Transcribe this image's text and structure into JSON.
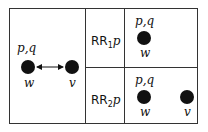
{
  "left_panel": {
    "w_label": "w",
    "v_label": "v",
    "pq_label": "p,q",
    "edge": "bidirectional-arrow"
  },
  "rows": [
    {
      "rule_prefix": "RR",
      "rule_sub": "1",
      "rule_arg": "p",
      "pq_label": "p,q",
      "w_label": "w"
    },
    {
      "rule_prefix": "RR",
      "rule_sub": "2",
      "rule_arg": "p",
      "pq_label": "p,q",
      "w_label": "w",
      "v_label": "v"
    }
  ]
}
